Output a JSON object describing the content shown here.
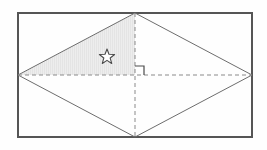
{
  "figure": {
    "canvas": {
      "width": 267,
      "height": 150,
      "background": "#fefefe"
    },
    "colors": {
      "border_dark": "#555555",
      "border_light": "#b8b8b8",
      "outline": "#6d6d6d",
      "dashed": "#8a8a8a",
      "shade_fill": "#ececec",
      "hatch": "#dcdcdc",
      "marker": "#4a4a4a"
    },
    "rectangle": {
      "name": "bounding-rectangle",
      "left": 18,
      "top": 13,
      "right": 252,
      "bottom": 137,
      "stroke_width": 2
    },
    "rhombus": {
      "name": "inscribed-rhombus",
      "vertices": [
        {
          "label": "left",
          "x": 18,
          "y": 75
        },
        {
          "label": "top",
          "x": 135,
          "y": 13
        },
        {
          "label": "right",
          "x": 252,
          "y": 75
        },
        {
          "label": "bottom",
          "x": 135,
          "y": 137
        }
      ],
      "stroke_width": 1
    },
    "diagonals": [
      {
        "name": "horizontal-diagonal",
        "x1": 18,
        "y1": 75,
        "x2": 252,
        "y2": 75,
        "style": "dashed"
      },
      {
        "name": "vertical-diagonal",
        "x1": 135,
        "y1": 13,
        "x2": 135,
        "y2": 137,
        "style": "dashed"
      }
    ],
    "center": {
      "x": 135,
      "y": 75
    },
    "shaded_region": {
      "name": "shaded-triangle",
      "description": "upper-left triangle of the rhombus",
      "points": "18,75 135,13 135,75",
      "fill": "#ececec",
      "hatch": "vertical"
    },
    "right_angle_marker": {
      "name": "right-angle-marker",
      "x": 135,
      "y": 75,
      "size": 9,
      "quadrant": "upper-right"
    },
    "star_marker": {
      "name": "star-marker",
      "x": 107,
      "y": 57,
      "radius": 8,
      "points": 5
    }
  }
}
